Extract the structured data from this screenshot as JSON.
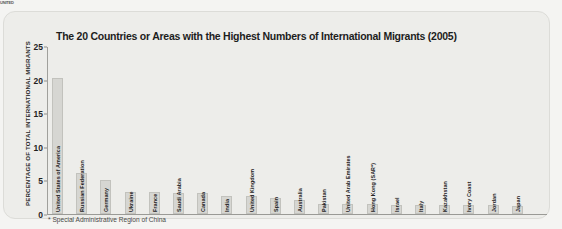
{
  "page": {
    "header_fragment": "UNITED"
  },
  "chart_data": {
    "type": "bar",
    "title": "The 20 Countries or Areas with the Highest Numbers of International Migrants (2005)",
    "xlabel": "",
    "ylabel": "PERCENTAGE OF TOTAL INTERNATIONAL MIGRANTS",
    "ylim": [
      0,
      25
    ],
    "yticks": [
      0,
      5,
      10,
      15,
      20,
      25
    ],
    "grid": false,
    "legend": false,
    "footnote": "* Special Administrative Region of China",
    "categories": [
      "United States of America",
      "Russian Federation",
      "Germany",
      "Ukraine",
      "France",
      "Saudi Arabia",
      "Canada",
      "India",
      "United Kingdom",
      "Spain",
      "Australia",
      "Pakistan",
      "United Arab Emirates",
      "Hong Kong (SAR*)",
      "Israel",
      "Italy",
      "Kazakhstan",
      "Ivory Coast",
      "Jordan",
      "Japan"
    ],
    "values": [
      20.2,
      6.1,
      5.0,
      3.3,
      3.3,
      3.1,
      3.1,
      2.7,
      2.7,
      2.4,
      2.1,
      1.5,
      1.5,
      1.5,
      1.4,
      1.3,
      1.3,
      1.3,
      1.3,
      1.2
    ],
    "bar_color": "#d6d6d2",
    "bar_border_color": "#c2c2bd",
    "axis_color": "#9a9a96",
    "panel_color": "#ededea",
    "text_color": "#1d1d1d"
  }
}
